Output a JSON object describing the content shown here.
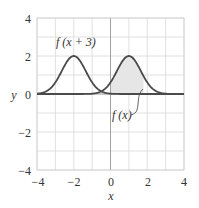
{
  "chart_data": {
    "type": "line",
    "title": "",
    "xlabel": "x",
    "ylabel": "y",
    "xlim": [
      -4,
      4
    ],
    "ylim": [
      -4,
      4
    ],
    "grid": true,
    "x_ticks": [
      -4,
      -2,
      0,
      2,
      4
    ],
    "y_ticks": [
      -4,
      -2,
      0,
      2,
      4
    ],
    "x_tick_labels": [
      "−4",
      "−2",
      "0",
      "2",
      "4"
    ],
    "y_tick_labels": [
      "4",
      "2",
      "0",
      "−2",
      "−4"
    ],
    "series": [
      {
        "name": "f(x)",
        "description": "bell curve peaking at x=1, height 2",
        "peak": {
          "x": 1,
          "y": 2
        },
        "x": [
          -4,
          -1,
          -0.5,
          0,
          0.5,
          1,
          1.5,
          2,
          2.5,
          3,
          4
        ],
        "y": [
          0,
          0.01,
          0.14,
          0.61,
          1.49,
          2,
          1.49,
          0.61,
          0.14,
          0.01,
          0
        ]
      },
      {
        "name": "f(x + 3)",
        "description": "same bell curve shifted left by 3, peaking at x=-2",
        "peak": {
          "x": -2,
          "y": 2
        },
        "x": [
          -4,
          -3.5,
          -3,
          -2.5,
          -2,
          -1.5,
          -1,
          -0.5,
          0,
          4
        ],
        "y": [
          0.01,
          0.14,
          0.61,
          1.49,
          2,
          1.49,
          0.61,
          0.14,
          0.01,
          0
        ]
      }
    ],
    "shaded_region": {
      "under": "f(x)",
      "x_from": 0,
      "x_to": 1.8
    },
    "annotations": [
      {
        "text": "f (x + 3)",
        "x": -2.6,
        "y": 3.3
      },
      {
        "text": "f (x)",
        "x": 0.4,
        "y": -0.95,
        "pointer_to": {
          "x": 1.7,
          "y": 0.8
        }
      }
    ]
  },
  "labels": {
    "y_axis": "y",
    "x_axis": "x",
    "f_shift": "f (x + 3)",
    "f": "f (x)",
    "yt4": "4",
    "yt2": "2",
    "yt0": "0",
    "ytm2": "−2",
    "ytm4": "−4",
    "xtm4": "−4",
    "xtm2": "−2",
    "xt0": "0",
    "xt2": "2",
    "xt4": "4"
  }
}
